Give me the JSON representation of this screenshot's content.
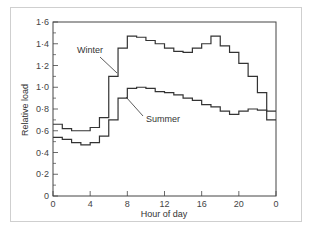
{
  "chart_data": {
    "type": "line",
    "style": "step",
    "title": "",
    "xlabel": "Hour of day",
    "ylabel": "Relative load",
    "xlim": [
      0,
      24
    ],
    "ylim": [
      0,
      1.6
    ],
    "x_ticks": [
      0,
      4,
      8,
      12,
      16,
      20,
      24
    ],
    "x_tick_labels": [
      "0",
      "4",
      "8",
      "12",
      "16",
      "20",
      "0"
    ],
    "y_ticks": [
      0,
      0.2,
      0.4,
      0.6,
      0.8,
      1.0,
      1.2,
      1.4,
      1.6
    ],
    "y_tick_labels": [
      "0",
      "0·2",
      "0·4",
      "0·6",
      "0·8",
      "1·0",
      "1·2",
      "1·4",
      "1·6"
    ],
    "grid": false,
    "legend": "inline annotations",
    "x": [
      0,
      1,
      2,
      3,
      4,
      5,
      6,
      7,
      8,
      9,
      10,
      11,
      12,
      13,
      14,
      15,
      16,
      17,
      18,
      19,
      20,
      21,
      22,
      23
    ],
    "series": [
      {
        "name": "Winter",
        "values": [
          0.66,
          0.62,
          0.6,
          0.6,
          0.63,
          0.72,
          1.1,
          1.36,
          1.47,
          1.46,
          1.43,
          1.4,
          1.36,
          1.33,
          1.32,
          1.36,
          1.4,
          1.47,
          1.38,
          1.32,
          1.22,
          1.1,
          0.95,
          0.78
        ]
      },
      {
        "name": "Summer",
        "values": [
          0.54,
          0.52,
          0.49,
          0.47,
          0.49,
          0.55,
          0.7,
          0.9,
          0.99,
          1.0,
          0.99,
          0.96,
          0.95,
          0.93,
          0.9,
          0.88,
          0.84,
          0.82,
          0.78,
          0.75,
          0.78,
          0.8,
          0.79,
          0.7
        ]
      }
    ]
  },
  "annotations": {
    "winter_label": "Winter",
    "summer_label": "Summer"
  },
  "axes": {
    "x_title": "Hour of day",
    "y_title": "Relative load"
  }
}
